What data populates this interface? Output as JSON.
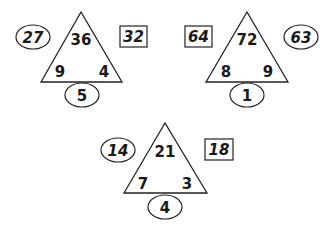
{
  "puzzles": [
    {
      "top": "36",
      "left": "9",
      "right": "4",
      "bottom": "5",
      "left_outside": {
        "value": "27",
        "shape": "oval"
      },
      "right_outside": {
        "value": "32",
        "shape": "box"
      }
    },
    {
      "top": "72",
      "left": "8",
      "right": "9",
      "bottom": "1",
      "left_outside": {
        "value": "64",
        "shape": "box"
      },
      "right_outside": {
        "value": "63",
        "shape": "oval"
      }
    },
    {
      "top": "21",
      "left": "7",
      "right": "3",
      "bottom": "4",
      "left_outside": {
        "value": "14",
        "shape": "oval"
      },
      "right_outside": {
        "value": "18",
        "shape": "box"
      }
    }
  ]
}
